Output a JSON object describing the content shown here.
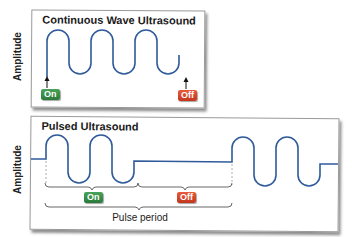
{
  "panels": {
    "continuous": {
      "title": "Continuous Wave Ultrasound",
      "y_axis_label": "Amplitude",
      "on_label": "On",
      "off_label": "Off"
    },
    "pulsed": {
      "title": "Pulsed Ultrasound",
      "y_axis_label": "Amplitude",
      "on_label": "On",
      "off_label": "Off",
      "period_label": "Pulse period"
    }
  },
  "colors": {
    "wave": "#2f5b9a",
    "on_badge": "#2e8b3e",
    "off_badge": "#d9442a",
    "frame": "#9a9a9a"
  }
}
